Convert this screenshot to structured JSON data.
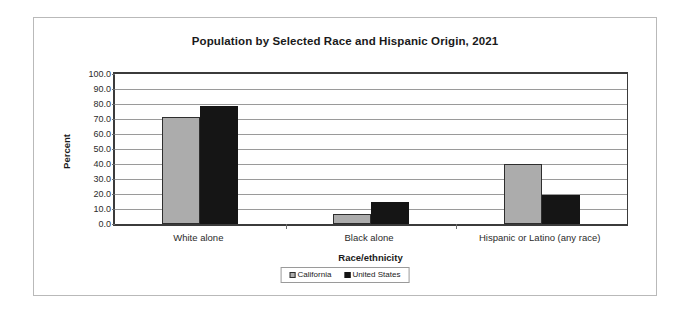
{
  "chart_data": {
    "type": "bar",
    "title": "Population by Selected Race and Hispanic Origin, 2021",
    "xlabel": "Race/ethnicity",
    "ylabel": "Percent",
    "ylim": [
      0,
      100
    ],
    "ytick_step": 10,
    "ytick_labels": [
      "0.0",
      "10.0",
      "20.0",
      "30.0",
      "40.0",
      "50.0",
      "60.0",
      "70.0",
      "80.0",
      "90.0",
      "100.0"
    ],
    "ytick_values": [
      0,
      10,
      20,
      30,
      40,
      50,
      60,
      70,
      80,
      90,
      100
    ],
    "grid": true,
    "legend_position": "bottom",
    "categories": [
      "White alone",
      "Black alone",
      "Hispanic or Latino (any race)"
    ],
    "series": [
      {
        "name": "California",
        "color": "#acacac",
        "values": [
          71.1,
          6.5,
          40.3
        ]
      },
      {
        "name": "United States",
        "color": "#151515",
        "values": [
          78.8,
          15.0,
          19.5
        ]
      }
    ]
  },
  "figure": {
    "border_color": "#b9b9b9",
    "background": "#ffffff"
  },
  "legend": {
    "items": [
      {
        "label": "California"
      },
      {
        "label": "United States"
      }
    ]
  }
}
